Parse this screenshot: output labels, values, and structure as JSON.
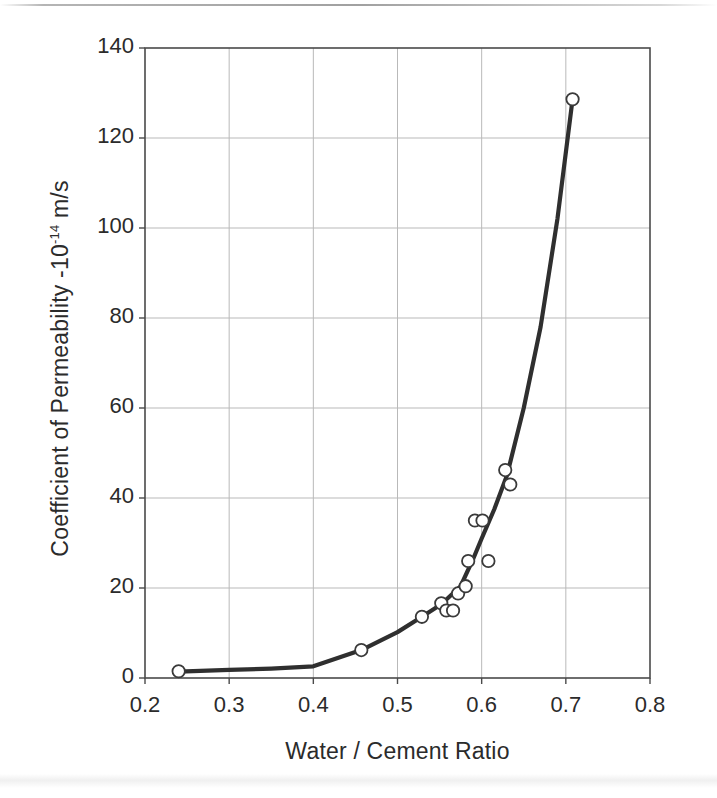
{
  "chart_data": {
    "type": "scatter",
    "title": "",
    "xlabel": "Water / Cement Ratio",
    "ylabel": "Coefficient of Permeability -10",
    "ylabel_exponent": "-14",
    "ylabel_units": "m/s",
    "xlim": [
      0.2,
      0.8
    ],
    "ylim": [
      0,
      140
    ],
    "xticks": [
      "0.2",
      "0.3",
      "0.4",
      "0.5",
      "0.6",
      "0.7",
      "0.8"
    ],
    "xtick_values": [
      0.2,
      0.3,
      0.4,
      0.5,
      0.6,
      0.7,
      0.8
    ],
    "yticks": [
      "0",
      "20",
      "40",
      "60",
      "80",
      "100",
      "120",
      "140"
    ],
    "ytick_values": [
      0,
      20,
      40,
      60,
      80,
      100,
      120,
      140
    ],
    "grid": true,
    "legend": "none",
    "marker": "open-circle",
    "marker_color": "#ffffff",
    "marker_edge_color": "#3a3a3a",
    "line_color": "#2f2f2f",
    "axis_color": "#4a4a4a",
    "grid_color": "#b9b9b9",
    "background": "#ffffff",
    "series": [
      {
        "name": "Measured permeability",
        "type": "scatter",
        "points": [
          {
            "x": 0.24,
            "y": 1.5
          },
          {
            "x": 0.457,
            "y": 6.2
          },
          {
            "x": 0.529,
            "y": 13.6
          },
          {
            "x": 0.552,
            "y": 16.6
          },
          {
            "x": 0.558,
            "y": 15.0
          },
          {
            "x": 0.566,
            "y": 15.0
          },
          {
            "x": 0.572,
            "y": 18.8
          },
          {
            "x": 0.581,
            "y": 20.4
          },
          {
            "x": 0.584,
            "y": 26.0
          },
          {
            "x": 0.592,
            "y": 35.0
          },
          {
            "x": 0.601,
            "y": 35.0
          },
          {
            "x": 0.608,
            "y": 26.0
          },
          {
            "x": 0.628,
            "y": 46.2
          },
          {
            "x": 0.634,
            "y": 43.0
          },
          {
            "x": 0.708,
            "y": 128.6
          }
        ]
      },
      {
        "name": "Fitted trend curve",
        "type": "line",
        "points": [
          {
            "x": 0.24,
            "y": 1.4
          },
          {
            "x": 0.3,
            "y": 1.8
          },
          {
            "x": 0.35,
            "y": 2.1
          },
          {
            "x": 0.4,
            "y": 2.6
          },
          {
            "x": 0.457,
            "y": 6.2
          },
          {
            "x": 0.5,
            "y": 10.2
          },
          {
            "x": 0.529,
            "y": 13.6
          },
          {
            "x": 0.552,
            "y": 16.4
          },
          {
            "x": 0.575,
            "y": 20.4
          },
          {
            "x": 0.59,
            "y": 26.5
          },
          {
            "x": 0.6,
            "y": 31.0
          },
          {
            "x": 0.615,
            "y": 37.5
          },
          {
            "x": 0.63,
            "y": 45.0
          },
          {
            "x": 0.65,
            "y": 60.0
          },
          {
            "x": 0.67,
            "y": 78.0
          },
          {
            "x": 0.69,
            "y": 102.0
          },
          {
            "x": 0.708,
            "y": 128.6
          }
        ]
      }
    ]
  }
}
